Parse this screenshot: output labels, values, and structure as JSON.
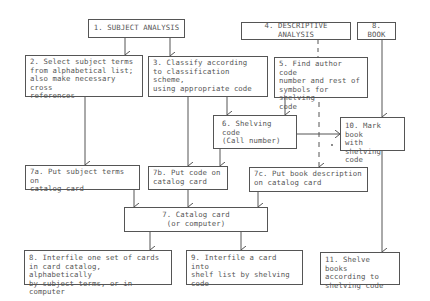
{
  "diagram": {
    "boxes": {
      "b1": "1. SUBJECT ANALYSIS",
      "b2": "2. Select subject terms\nfrom alphabetical list;\nalso make necessary cross\nreferences",
      "b3": "3. Classify according\nto classification scheme,\nusing appropriate code",
      "b4": "4. DESCRIPTIVE ANALYSIS",
      "b5": "5. Find author code\nnumber and rest of\nsymbols for shelving\ncode",
      "b6": "6. Shelving code\n(Call number)",
      "b7": "7. Catalog card\n(or computer)",
      "b7a": "7a. Put subject terms on\ncatalog card",
      "b7b": "7b. Put code on\ncatalog card",
      "b7c": "7c. Put book description\non catalog card",
      "b8book": "8. BOOK",
      "b8": "8. Interfile one set of cards\nin card catalog, alphabetically\nby subject terms, or in computer",
      "b9": "9. Interfile a card into\nshelf list by shelving\ncode",
      "b10": "10. Mark book\nwith shelving\ncode",
      "b11": "11. Shelve books\naccording to\nshelving code"
    },
    "line_color": "#555555"
  }
}
